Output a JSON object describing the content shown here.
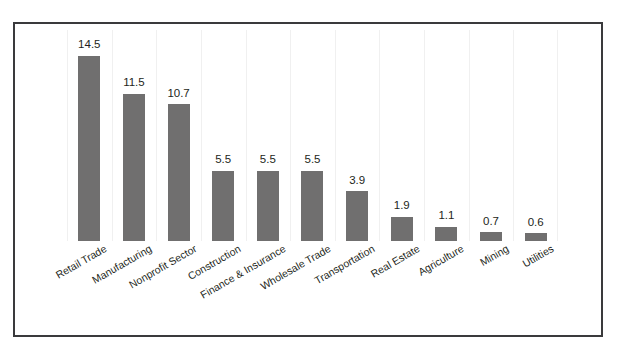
{
  "chart_data": {
    "type": "bar",
    "title": "",
    "subtitle": "",
    "xlabel": "",
    "ylabel": "",
    "categories": [
      "Retail Trade",
      "Manufacturing",
      "Nonprofit Sector",
      "Construction",
      "Finance & Insurance",
      "Wholesale Trade",
      "Transportation",
      "Real Estate",
      "Agriculture",
      "Mining",
      "Utilities"
    ],
    "values": [
      14.5,
      11.5,
      10.7,
      5.5,
      5.5,
      5.5,
      3.9,
      1.9,
      1.1,
      0.7,
      0.6
    ],
    "value_labels": [
      "14.5",
      "11.5",
      "10.7",
      "5.5",
      "5.5",
      "5.5",
      "3.9",
      "1.9",
      "1.1",
      "0.7",
      "0.6"
    ],
    "ylim": [
      0,
      16.5
    ],
    "grid": "vertical-category-separators",
    "legend": "none",
    "bar_color": "#706f6f",
    "label_color": "#231f20",
    "gridline_color": "#f0f0f0",
    "frame_color": "#3a3a3c",
    "background": "#ffffff",
    "label_rotation_deg": -30
  }
}
